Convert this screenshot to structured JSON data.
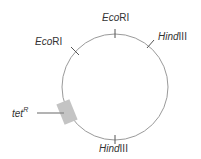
{
  "diagram": {
    "type": "plasmid-map",
    "circle": {
      "cx": 115,
      "cy": 87,
      "r": 53,
      "stroke": "#9a9a9a"
    },
    "sites": [
      {
        "name": "EcoRI",
        "italic": "Eco",
        "roman": "RI",
        "label_x": 104,
        "label_y": 21,
        "tick": [
          115,
          30,
          115,
          38
        ]
      },
      {
        "name": "EcoRI",
        "italic": "Eco",
        "roman": "RI",
        "label_x": 36,
        "label_y": 44,
        "tick": [
          72,
          48,
          79,
          54
        ]
      },
      {
        "name": "HindIII",
        "italic": "Hind",
        "roman": "III",
        "label_x": 158,
        "label_y": 40,
        "tick": [
          148,
          47,
          155,
          40
        ]
      },
      {
        "name": "HindIII",
        "italic": "Hind",
        "roman": "III",
        "label_x": 100,
        "label_y": 150,
        "tick": [
          115,
          136,
          115,
          144
        ]
      }
    ],
    "marker": {
      "name": "tetR",
      "label_base": "tet",
      "label_sup": "R",
      "color": "#c4c4c4",
      "line_color": "#8a8a8a"
    }
  }
}
